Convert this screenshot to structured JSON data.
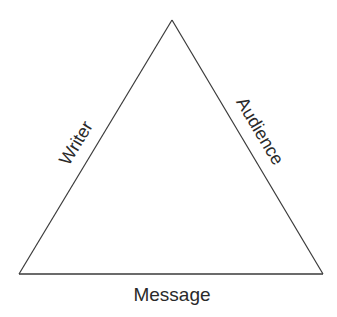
{
  "diagram": {
    "type": "rhetorical-triangle",
    "shape": "triangle",
    "stroke_color": "#3a3a3a",
    "background": "#ffffff",
    "vertices": {
      "apex": [
        172,
        20
      ],
      "bottom_left": [
        19,
        274
      ],
      "bottom_right": [
        323,
        274
      ]
    },
    "labels": {
      "left_side": "Writer",
      "right_side": "Audience",
      "base": "Message"
    }
  }
}
